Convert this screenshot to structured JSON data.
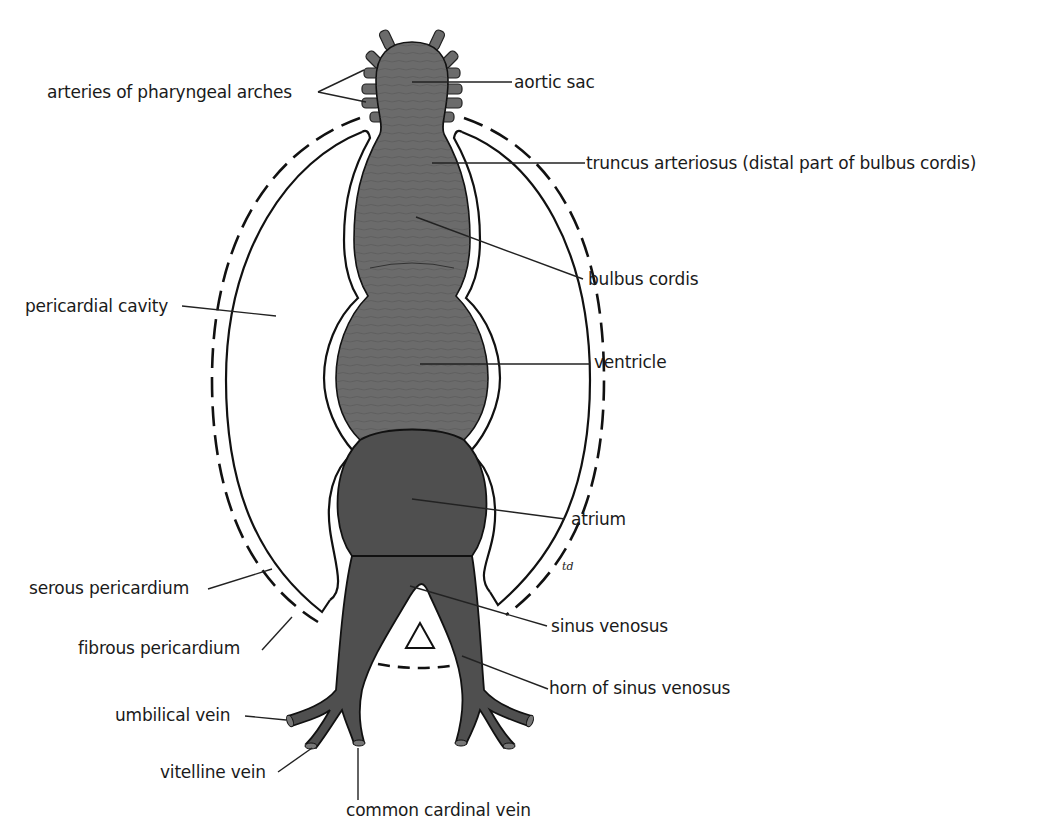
{
  "figure": {
    "signature": "td",
    "colors": {
      "background": "#ffffff",
      "outline": "#111111",
      "tube_light": "#6b6b6b",
      "tube_dark": "#4f4f4f",
      "leader_line": "#222222",
      "label_text": "#1a1a1a"
    }
  },
  "labels": {
    "arteries_of_pharyngeal_arches": "arteries of pharyngeal arches",
    "aortic_sac": "aortic sac",
    "truncus_arteriosus": "truncus arteriosus (distal part of bulbus cordis)",
    "bulbus_cordis": "bulbus cordis",
    "pericardial_cavity": "pericardial cavity",
    "ventricle": "ventricle",
    "atrium": "atrium",
    "serous_pericardium": "serous pericardium",
    "fibrous_pericardium": "fibrous pericardium",
    "sinus_venosus": "sinus venosus",
    "horn_of_sinus_venosus": "horn of sinus venosus",
    "umbilical_vein": "umbilical vein",
    "vitelline_vein": "vitelline vein",
    "common_cardinal_vein": "common cardinal vein"
  }
}
